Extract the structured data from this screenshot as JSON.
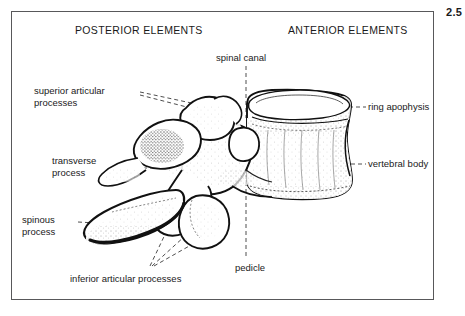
{
  "figure": {
    "number": "2.5",
    "headers": {
      "posterior": "POSTERIOR ELEMENTS",
      "anterior": "ANTERIOR ELEMENTS"
    },
    "labels": {
      "spinal_canal": "spinal canal",
      "superior_articular_line1": "superior articular",
      "superior_articular_line2": "processes",
      "transverse_line1": "transverse",
      "transverse_line2": "process",
      "spinous_line1": "spinous",
      "spinous_line2": "process",
      "inferior_articular": "inferior articular processes",
      "pedicle": "pedicle",
      "ring_apophysis": "ring apophysis",
      "vertebral_body": "vertebral body"
    },
    "colors": {
      "frame": "#58585a",
      "ink": "#1a1a1a",
      "background": "#ffffff",
      "leader": "#3a3a3a"
    }
  }
}
